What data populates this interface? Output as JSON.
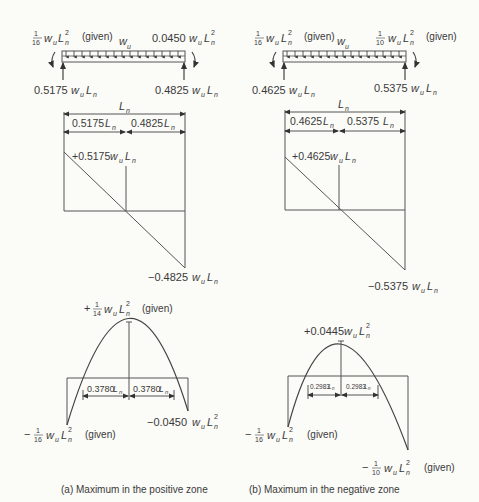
{
  "panels": [
    {
      "id": "a",
      "caption": "(a)  Maximum in the positive zone",
      "beam": {
        "left_moment": {
          "coef": "1/16",
          "num": "1",
          "den": "16",
          "expr": "w_u L_n^2",
          "note": "(given)"
        },
        "right_moment": {
          "coef": "0.0450",
          "expr": "w_u L_n^2",
          "note": ""
        },
        "load_label": "w_u",
        "left_reaction": {
          "coef": "0.5175",
          "expr": "w_u L_n"
        },
        "right_reaction": {
          "coef": "0.4825",
          "expr": "w_u L_n"
        }
      },
      "dimensions": {
        "span": "L_n",
        "left_segment": {
          "coef": "0.5175",
          "var": "L_n"
        },
        "right_segment": {
          "coef": "0.4825",
          "var": "L_n"
        }
      },
      "shear": {
        "max_positive": {
          "coef": "+0.5175",
          "expr": "w_u L_n"
        },
        "max_negative": {
          "coef": "−0.4825",
          "expr": "w_u L_n"
        }
      },
      "moment": {
        "peak": {
          "prefix": "+",
          "num": "1",
          "den": "14",
          "expr": "w_u L_n^2",
          "note": "(given)"
        },
        "left_end": {
          "prefix": "−",
          "num": "1",
          "den": "16",
          "expr": "w_u L_n^2",
          "note": "(given)"
        },
        "right_end": {
          "coef": "−0.0450",
          "expr": "w_u L_n^2"
        },
        "zero_to_peak_left": {
          "coef": "0.3780",
          "var": "L_n"
        },
        "zero_to_peak_right": {
          "coef": "0.3780",
          "var": "L_n"
        }
      }
    },
    {
      "id": "b",
      "caption": "(b)  Maximum in the negative zone",
      "beam": {
        "left_moment": {
          "coef": "1/16",
          "num": "1",
          "den": "16",
          "expr": "w_u L_n^2",
          "note": "(given)"
        },
        "right_moment": {
          "coef": "1/10",
          "num": "1",
          "den": "10",
          "expr": "w_u L_n^2",
          "note": "(given)"
        },
        "load_label": "w_u",
        "left_reaction": {
          "coef": "0.4625",
          "expr": "w_u L_n"
        },
        "right_reaction": {
          "coef": "0.5375",
          "expr": "w_u L_n"
        }
      },
      "dimensions": {
        "span": "L_n",
        "left_segment": {
          "coef": "0.4625",
          "var": "L_n"
        },
        "right_segment": {
          "coef": "0.5375",
          "var": "L_n"
        }
      },
      "shear": {
        "max_positive": {
          "coef": "+0.4625",
          "expr": "w_u L_n"
        },
        "max_negative": {
          "coef": "−0.5375",
          "expr": "w_u L_n"
        }
      },
      "moment": {
        "peak": {
          "coef": "+0.0445",
          "expr": "w_u L_n^2",
          "note": ""
        },
        "left_end": {
          "prefix": "−",
          "num": "1",
          "den": "16",
          "expr": "w_u L_n^2",
          "note": "(given)"
        },
        "right_end": {
          "prefix": "−",
          "num": "1",
          "den": "10",
          "expr": "w_u L_n^2",
          "note": "(given)"
        },
        "zero_to_peak_left": {
          "coef": "0.2983",
          "var": "L_n"
        },
        "zero_to_peak_right": {
          "coef": "0.2983",
          "var": "L_n"
        }
      }
    }
  ],
  "symbols": {
    "w": "w",
    "u": "u",
    "L": "L",
    "n": "n",
    "sq": "2"
  }
}
